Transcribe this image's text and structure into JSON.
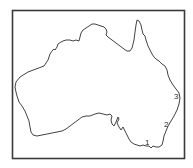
{
  "map": {
    "subject": "Australia outline map",
    "frame_color": "#3a3a3a",
    "coast_color": "#2e2e2e",
    "labels": [
      {
        "text": "1",
        "x": 145,
        "y": 139
      },
      {
        "text": "2",
        "x": 164,
        "y": 121
      },
      {
        "text": "3",
        "x": 174,
        "y": 93
      }
    ]
  }
}
